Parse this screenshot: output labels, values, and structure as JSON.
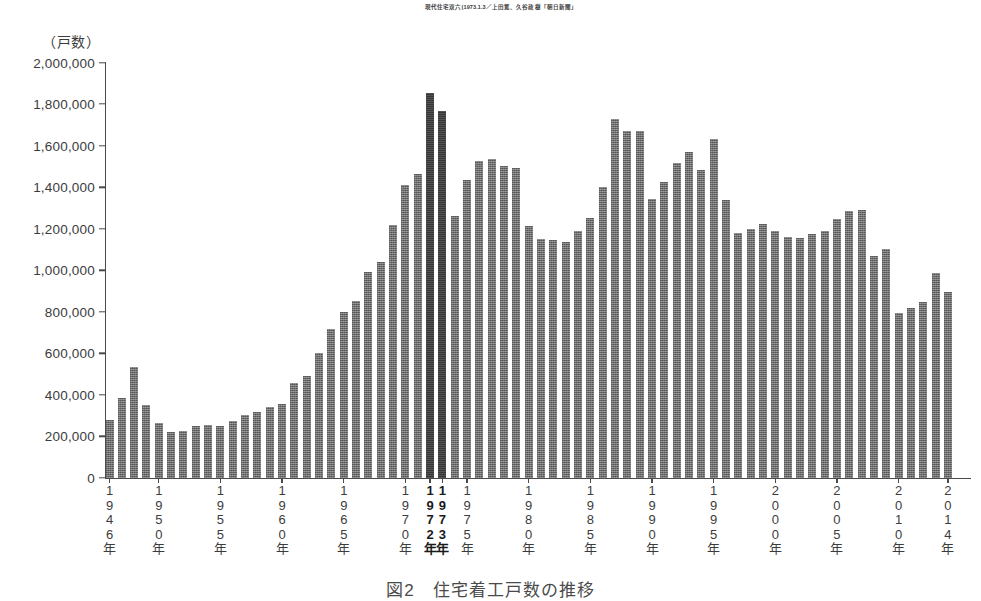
{
  "source_credit": "現代住宅双六(1973.1.3／上田篤、久谷政樹「朝日新聞」",
  "source_ghost": "",
  "figure_caption": "図2　住宅着工戸数の推移",
  "chart_data": {
    "type": "bar",
    "title": "図2　住宅着工戸数の推移",
    "xlabel": "",
    "ylabel": "（戸数）",
    "ylim": [
      0,
      2000000
    ],
    "ytick_step": 200000,
    "grid": false,
    "legend": "none",
    "ytick_labels": [
      "2,000,000",
      "1,800,000",
      "1,600,000",
      "1,400,000",
      "1,200,000",
      "1,000,000",
      "800,000",
      "600,000",
      "400,000",
      "200,000",
      "0"
    ],
    "ytick_values": [
      2000000,
      1800000,
      1600000,
      1400000,
      1200000,
      1000000,
      800000,
      600000,
      400000,
      200000,
      0
    ],
    "xtick_labels": [
      {
        "year": 1946,
        "text": "1946年",
        "bold": false
      },
      {
        "year": 1950,
        "text": "1950年",
        "bold": false
      },
      {
        "year": 1955,
        "text": "1955年",
        "bold": false
      },
      {
        "year": 1960,
        "text": "1960年",
        "bold": false
      },
      {
        "year": 1965,
        "text": "1965年",
        "bold": false
      },
      {
        "year": 1970,
        "text": "1970年",
        "bold": false
      },
      {
        "year": 1972,
        "text": "1972年",
        "bold": true
      },
      {
        "year": 1973,
        "text": "1973年",
        "bold": true
      },
      {
        "year": 1975,
        "text": "1975年",
        "bold": false
      },
      {
        "year": 1980,
        "text": "1980年",
        "bold": false
      },
      {
        "year": 1985,
        "text": "1985年",
        "bold": false
      },
      {
        "year": 1990,
        "text": "1990年",
        "bold": false
      },
      {
        "year": 1995,
        "text": "1995年",
        "bold": false
      },
      {
        "year": 2000,
        "text": "2000年",
        "bold": false
      },
      {
        "year": 2005,
        "text": "2005年",
        "bold": false
      },
      {
        "year": 2010,
        "text": "2010年",
        "bold": false
      },
      {
        "year": 2014,
        "text": "2014年",
        "bold": false
      }
    ],
    "highlight_years": [
      1972,
      1973
    ],
    "highlight_color": "#373737",
    "bar_color": "#6d6d6d",
    "categories": [
      1946,
      1947,
      1948,
      1949,
      1950,
      1951,
      1952,
      1953,
      1954,
      1955,
      1956,
      1957,
      1958,
      1959,
      1960,
      1961,
      1962,
      1963,
      1964,
      1965,
      1966,
      1967,
      1968,
      1969,
      1970,
      1971,
      1972,
      1973,
      1974,
      1975,
      1976,
      1977,
      1978,
      1979,
      1980,
      1981,
      1982,
      1983,
      1984,
      1985,
      1986,
      1987,
      1988,
      1989,
      1990,
      1991,
      1992,
      1993,
      1994,
      1995,
      1996,
      1997,
      1998,
      1999,
      2000,
      2001,
      2002,
      2003,
      2004,
      2005,
      2006,
      2007,
      2008,
      2009,
      2010,
      2011,
      2012,
      2013,
      2014
    ],
    "values": [
      280000,
      385000,
      535000,
      350000,
      265000,
      220000,
      225000,
      250000,
      255000,
      250000,
      275000,
      305000,
      320000,
      340000,
      355000,
      455000,
      490000,
      600000,
      715000,
      800000,
      850000,
      990000,
      1040000,
      1220000,
      1410000,
      1465000,
      1855000,
      1765000,
      1260000,
      1435000,
      1525000,
      1535000,
      1500000,
      1490000,
      1215000,
      1150000,
      1145000,
      1135000,
      1190000,
      1250000,
      1400000,
      1730000,
      1670000,
      1670000,
      1345000,
      1425000,
      1515000,
      1570000,
      1485000,
      1630000,
      1340000,
      1180000,
      1200000,
      1225000,
      1190000,
      1160000,
      1155000,
      1175000,
      1190000,
      1245000,
      1285000,
      1290000,
      1070000,
      1100000,
      795000,
      820000,
      845000,
      985000,
      895000
    ],
    "data_note": "日本の住宅着工戸数（1946年〜2014年）。1972年が最大値 約1,855,000戸。"
  }
}
